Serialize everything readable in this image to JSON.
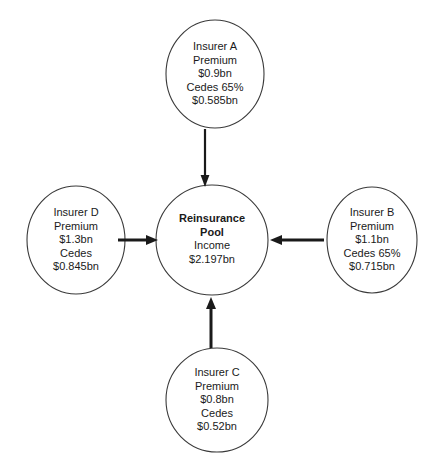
{
  "diagram": {
    "type": "hub-and-spoke",
    "background_color": "#ffffff",
    "stroke_color": "#3a3a3a",
    "arrow_color": "#1a1a1a",
    "center": {
      "id": "reinsurance-pool",
      "lines": [
        "Reinsurance",
        "Pool",
        "Income",
        "$2.197bn"
      ],
      "bold_lines": [
        "Reinsurance",
        "Pool"
      ],
      "title": "Reinsurance Pool",
      "income_label": "Income",
      "income_value": "$2.197bn"
    },
    "nodes": [
      {
        "id": "insurer-a",
        "position": "top",
        "name": "Insurer A",
        "premium_label": "Premium",
        "premium_value": "$0.9bn",
        "cedes_label": "Cedes 65%",
        "cedes_value": "$0.585bn",
        "lines": [
          "Insurer A",
          "Premium",
          "$0.9bn",
          "Cedes 65%",
          "$0.585bn"
        ]
      },
      {
        "id": "insurer-b",
        "position": "right",
        "name": "Insurer B",
        "premium_label": "Premium",
        "premium_value": "$1.1bn",
        "cedes_label": "Cedes 65%",
        "cedes_value": "$0.715bn",
        "lines": [
          "Insurer B",
          "Premium",
          "$1.1bn",
          "Cedes 65%",
          "$0.715bn"
        ]
      },
      {
        "id": "insurer-c",
        "position": "bottom",
        "name": "Insurer C",
        "premium_label": "Premium",
        "premium_value": "$0.8bn",
        "cedes_label": "Cedes",
        "cedes_value": "$0.52bn",
        "lines": [
          "Insurer C",
          "Premium",
          "$0.8bn",
          "Cedes",
          "$0.52bn"
        ]
      },
      {
        "id": "insurer-d",
        "position": "left",
        "name": "Insurer D",
        "premium_label": "Premium",
        "premium_value": "$1.3bn",
        "cedes_label": "Cedes",
        "cedes_value": "$0.845bn",
        "lines": [
          "Insurer D",
          "Premium",
          "$1.3bn",
          "Cedes",
          "$0.845bn"
        ]
      }
    ],
    "arrows": [
      {
        "id": "arrow-a-to-pool",
        "from": "insurer-a",
        "to": "reinsurance-pool",
        "direction": "down"
      },
      {
        "id": "arrow-b-to-pool",
        "from": "insurer-b",
        "to": "reinsurance-pool",
        "direction": "left"
      },
      {
        "id": "arrow-c-to-pool",
        "from": "insurer-c",
        "to": "reinsurance-pool",
        "direction": "up"
      },
      {
        "id": "arrow-d-to-pool",
        "from": "insurer-d",
        "to": "reinsurance-pool",
        "direction": "right"
      }
    ]
  }
}
